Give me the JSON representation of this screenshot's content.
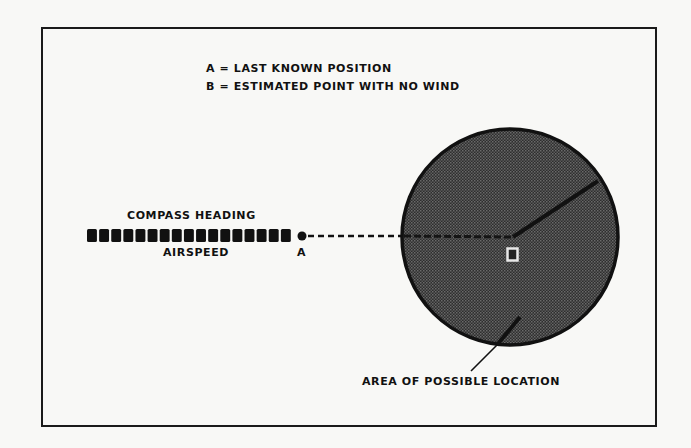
{
  "legend": {
    "lines": [
      "A = LAST KNOWN POSITION",
      "B = ESTIMATED POINT WITH NO WIND"
    ]
  },
  "labels": {
    "compass_heading": "COMPASS HEADING",
    "airspeed": "AIRSPEED",
    "point_a": "A",
    "point_b": "B",
    "area": "AREA OF POSSIBLE LOCATION"
  },
  "diagram": {
    "track_squares_count": 17,
    "circle": {
      "center_x": 510,
      "center_y": 237,
      "radius": 109,
      "fill_color": "#3a3a3a",
      "border_color": "#111111"
    },
    "colors": {
      "ink": "#111111",
      "paper": "#f8f8f6"
    }
  }
}
